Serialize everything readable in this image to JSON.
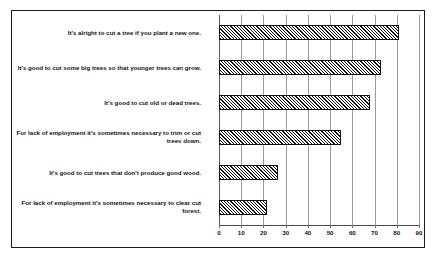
{
  "chart_data": {
    "type": "bar",
    "orientation": "horizontal",
    "title": "",
    "subtitle": "",
    "xlabel": "",
    "ylabel": "",
    "xlim": [
      0,
      90
    ],
    "xticks": [
      "0",
      "10",
      "20",
      "30",
      "40",
      "50",
      "60",
      "70",
      "80",
      "90"
    ],
    "xtick_values": [
      0,
      10,
      20,
      30,
      40,
      50,
      60,
      70,
      80,
      90
    ],
    "grid": true,
    "legend": false,
    "bar_style": {
      "fill": "diagonal-hatch",
      "hatch_color": "#111111",
      "background_color": "#ffffff",
      "border_color": "#111111"
    },
    "categories": [
      "It's alright to cut a tree if you plant a new one.",
      "It's good to cut some big trees so that younger trees can grow.",
      "It's good to cut old or dead trees.",
      "For lack of employment it's sometimes necessary to trim or cut trees down.",
      "It's good to cut trees that don't produce good wood.",
      "For lack of employment it's sometimes necessary to clear cut forest."
    ],
    "values": [
      81,
      73,
      68,
      55,
      26.5,
      21.5
    ]
  },
  "colors": {
    "frame": "#1b1b1b",
    "gridline": "#9a9a9a",
    "axis": "#4a4a4a",
    "text": "#141414",
    "background": "#ffffff"
  }
}
